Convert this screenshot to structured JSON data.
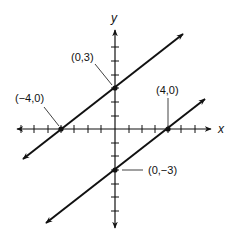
{
  "diagram": {
    "type": "coordinate-plane-graph",
    "axes": {
      "x_label": "x",
      "y_label": "y",
      "origin_px": [
        115,
        129
      ],
      "unit_px_x": 13.4,
      "unit_px_y": 13.8,
      "x_ticks": [
        -7,
        -6,
        -5,
        -4,
        -3,
        -2,
        -1,
        1,
        2,
        3,
        4,
        5,
        6
      ],
      "y_ticks": [
        7,
        6,
        5,
        4,
        3,
        2,
        1,
        -1,
        -2,
        -3,
        -4,
        -5,
        -6,
        -7
      ]
    },
    "lines": [
      {
        "name": "upper-line",
        "equation": "y = 3/4 x + 3",
        "slope": 0.75,
        "intercept": 3,
        "from": [
          -6.9,
          -2.2
        ],
        "to": [
          5.1,
          6.8
        ]
      },
      {
        "name": "lower-line",
        "equation": "y = 3/4 x - 3",
        "slope": 0.75,
        "intercept": -3,
        "from": [
          -5.1,
          -6.8
        ],
        "to": [
          6.7,
          2.2
        ]
      }
    ],
    "points": [
      {
        "name": "point-0-3",
        "label": "(0,3)",
        "x": 0,
        "y": 3
      },
      {
        "name": "point-neg4-0",
        "label": "(−4,0)",
        "x": -4,
        "y": 0
      },
      {
        "name": "point-4-0",
        "label": "(4,0)",
        "x": 4,
        "y": 0
      },
      {
        "name": "point-0-neg3",
        "label": "(0,−3)",
        "x": 0,
        "y": -3
      }
    ],
    "colors": {
      "ink": "#111111",
      "background": "#ffffff"
    }
  }
}
